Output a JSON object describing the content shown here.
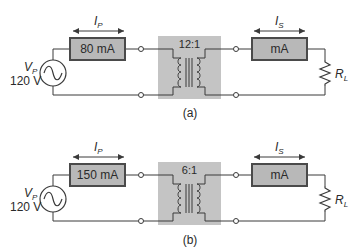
{
  "colors": {
    "wire": "#3a3a3a",
    "meter_fill": "#b8b8b8",
    "meter_border": "#4a4a4a",
    "transformer_bg": "#c4c4c4",
    "text": "#2a2a2a"
  },
  "panels": [
    {
      "caption": "(a)",
      "source": {
        "symbol_label": "V",
        "symbol_sub": "P",
        "voltage": "120 V"
      },
      "primary_current": {
        "symbol": "I",
        "sub": "P"
      },
      "primary_meter": {
        "reading": "80 mA"
      },
      "transformer": {
        "ratio": "12:1"
      },
      "secondary_current": {
        "symbol": "I",
        "sub": "S"
      },
      "secondary_meter": {
        "reading": "mA"
      },
      "load": {
        "symbol": "R",
        "sub": "L"
      }
    },
    {
      "caption": "(b)",
      "source": {
        "symbol_label": "V",
        "symbol_sub": "P",
        "voltage": "120 V"
      },
      "primary_current": {
        "symbol": "I",
        "sub": "P"
      },
      "primary_meter": {
        "reading": "150 mA"
      },
      "transformer": {
        "ratio": "6:1"
      },
      "secondary_current": {
        "symbol": "I",
        "sub": "S"
      },
      "secondary_meter": {
        "reading": "mA"
      },
      "load": {
        "symbol": "R",
        "sub": "L"
      }
    }
  ]
}
